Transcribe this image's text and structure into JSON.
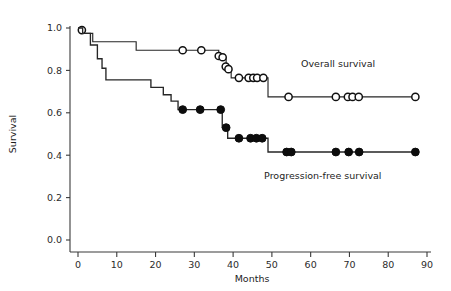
{
  "chart_data": {
    "type": "line",
    "title": "",
    "subtitle": "",
    "xlabel": "Months",
    "ylabel": "Survival",
    "xlim": [
      0,
      90
    ],
    "ylim": [
      0.0,
      1.0
    ],
    "xticks": [
      0,
      10,
      20,
      30,
      40,
      50,
      60,
      70,
      80,
      90
    ],
    "xtick_labels": [
      "0",
      "10",
      "20",
      "30",
      "40",
      "50",
      "60",
      "70",
      "80",
      "90"
    ],
    "yticks": [
      0.0,
      0.2,
      0.4,
      0.6,
      0.8,
      1.0
    ],
    "ytick_labels": [
      "0.0",
      "0.2",
      "0.4",
      "0.6",
      "0.8",
      "1.0"
    ],
    "grid": false,
    "legend_position": "inline-annotations",
    "plot_style": "kaplan-meier-step",
    "series": [
      {
        "name": "Overall survival",
        "label": "Overall survival",
        "marker": "open-circle",
        "marker_color": "#ffffff",
        "marker_edge_color": "#111111",
        "line_color": "#262626",
        "step_points": [
          [
            0,
            1.0
          ],
          [
            1.2,
            1.0
          ],
          [
            1.2,
            0.975
          ],
          [
            3.8,
            0.975
          ],
          [
            3.8,
            0.935
          ],
          [
            15.0,
            0.935
          ],
          [
            15.0,
            0.895
          ],
          [
            36.3,
            0.895
          ],
          [
            36.3,
            0.855
          ],
          [
            38.2,
            0.855
          ],
          [
            38.2,
            0.81
          ],
          [
            39.5,
            0.81
          ],
          [
            39.5,
            0.765
          ],
          [
            49.0,
            0.765
          ],
          [
            49.0,
            0.675
          ],
          [
            87.5,
            0.675
          ]
        ],
        "censor_points": [
          [
            1.0,
            0.99
          ],
          [
            27.0,
            0.895
          ],
          [
            31.8,
            0.895
          ],
          [
            36.3,
            0.868
          ],
          [
            37.3,
            0.862
          ],
          [
            38.1,
            0.818
          ],
          [
            38.8,
            0.806
          ],
          [
            41.5,
            0.765
          ],
          [
            44.0,
            0.765
          ],
          [
            45.2,
            0.765
          ],
          [
            46.2,
            0.765
          ],
          [
            47.8,
            0.765
          ],
          [
            54.3,
            0.675
          ],
          [
            66.5,
            0.675
          ],
          [
            69.6,
            0.675
          ],
          [
            70.8,
            0.675
          ],
          [
            72.4,
            0.675
          ],
          [
            87.0,
            0.675
          ]
        ]
      },
      {
        "name": "Progression-free survival",
        "label": "Progression-free survival",
        "marker": "filled-circle",
        "marker_color": "#0c0c0c",
        "marker_edge_color": "#0c0c0c",
        "line_color": "#262626",
        "step_points": [
          [
            0,
            1.0
          ],
          [
            1.2,
            1.0
          ],
          [
            1.2,
            0.975
          ],
          [
            3.2,
            0.975
          ],
          [
            3.2,
            0.92
          ],
          [
            5.0,
            0.92
          ],
          [
            5.0,
            0.855
          ],
          [
            6.2,
            0.855
          ],
          [
            6.2,
            0.81
          ],
          [
            7.2,
            0.81
          ],
          [
            7.2,
            0.755
          ],
          [
            18.8,
            0.755
          ],
          [
            18.8,
            0.72
          ],
          [
            22.0,
            0.72
          ],
          [
            22.0,
            0.685
          ],
          [
            24.0,
            0.685
          ],
          [
            24.0,
            0.655
          ],
          [
            25.8,
            0.655
          ],
          [
            25.8,
            0.615
          ],
          [
            37.2,
            0.615
          ],
          [
            37.2,
            0.53
          ],
          [
            38.6,
            0.53
          ],
          [
            38.6,
            0.48
          ],
          [
            49.0,
            0.48
          ],
          [
            49.0,
            0.415
          ],
          [
            87.5,
            0.415
          ]
        ],
        "censor_points": [
          [
            27.0,
            0.615
          ],
          [
            31.5,
            0.615
          ],
          [
            36.8,
            0.615
          ],
          [
            38.2,
            0.53
          ],
          [
            41.5,
            0.48
          ],
          [
            44.5,
            0.48
          ],
          [
            46.0,
            0.48
          ],
          [
            47.5,
            0.48
          ],
          [
            53.8,
            0.415
          ],
          [
            55.0,
            0.415
          ],
          [
            66.5,
            0.415
          ],
          [
            69.8,
            0.415
          ],
          [
            72.5,
            0.415
          ],
          [
            87.0,
            0.415
          ]
        ]
      }
    ],
    "annotations": [
      {
        "text": "Overall survival",
        "x": 57.5,
        "y": 0.815,
        "anchor": "start"
      },
      {
        "text": "Progression-free survival",
        "x": 48.0,
        "y": 0.29,
        "anchor": "start"
      }
    ],
    "colors": {
      "line": "#262626",
      "axis": "#3a3a3a",
      "text": "#1d1d1d",
      "marker_fill_open": "#ffffff",
      "marker_fill_closed": "#0c0c0c",
      "background": "#ffffff"
    }
  }
}
